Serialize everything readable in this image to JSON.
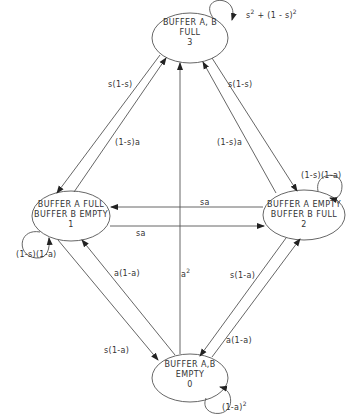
{
  "diagram": {
    "type": "state-transition",
    "nodes": [
      {
        "id": "3",
        "line1": "BUFFER A, B",
        "line2": "FULL",
        "number": "3"
      },
      {
        "id": "1",
        "line1": "BUFFER A FULL",
        "line2": "BUFFER B EMPTY",
        "number": "1"
      },
      {
        "id": "2",
        "line1": "BUFFER A EMPTY",
        "line2": "BUFFER B FULL",
        "number": "2"
      },
      {
        "id": "0",
        "line1": "BUFFER A,B",
        "line2": "EMPTY",
        "number": "0"
      }
    ],
    "self_loops": {
      "node3": {
        "base": "s",
        "exp": "2",
        "mid": " + (1 - s)",
        "exp2": "2"
      },
      "node1": "(1-s)(1-a)",
      "node2": "(1-s)(1-a)",
      "node0": {
        "base": "(1-a)",
        "exp": "2"
      }
    },
    "edges": [
      {
        "from": "3",
        "to": "1",
        "label": "s(1-s)"
      },
      {
        "from": "1",
        "to": "3",
        "label": "(1-s)a"
      },
      {
        "from": "3",
        "to": "2",
        "label": "s(1-s)"
      },
      {
        "from": "2",
        "to": "3",
        "label": "(1-s)a"
      },
      {
        "from": "2",
        "to": "1",
        "label": "sa"
      },
      {
        "from": "1",
        "to": "2",
        "label": "sa"
      },
      {
        "from": "0",
        "to": "3",
        "label": "a",
        "label_exp": "2"
      },
      {
        "from": "0",
        "to": "1",
        "label": "a(1-a)"
      },
      {
        "from": "1",
        "to": "0",
        "label": "s(1-a)"
      },
      {
        "from": "2",
        "to": "0",
        "label": "s(1-a)"
      },
      {
        "from": "0",
        "to": "2",
        "label": "a(1-a)"
      }
    ]
  }
}
